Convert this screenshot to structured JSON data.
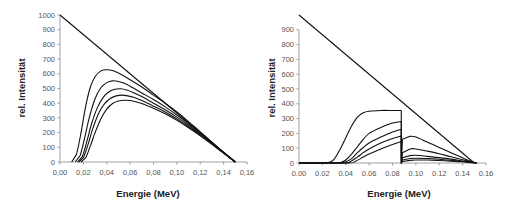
{
  "chart_data": [
    {
      "type": "line",
      "title": "",
      "xlabel": "Energie (MeV)",
      "ylabel": "rel. Intensität",
      "xlim": [
        0.0,
        0.16
      ],
      "ylim": [
        0,
        1000
      ],
      "decimal_separator": ",",
      "x_ticks": [
        "0,00",
        "0,02",
        "0,04",
        "0,06",
        "0,08",
        "0,10",
        "0,12",
        "0,14",
        "0,16"
      ],
      "y_ticks": [
        "0",
        "100",
        "200",
        "300",
        "400",
        "500",
        "600",
        "700",
        "800",
        "900",
        "1000"
      ],
      "grid": false,
      "legend": "none",
      "series": [
        {
          "name": "unfiltered",
          "x": [
            0.0,
            0.15
          ],
          "y": [
            1000,
            0
          ]
        },
        {
          "name": "filter-1",
          "x": [
            0.01,
            0.014,
            0.018,
            0.022,
            0.026,
            0.03,
            0.035,
            0.04,
            0.045,
            0.05,
            0.06,
            0.07,
            0.08,
            0.09,
            0.1,
            0.11,
            0.12,
            0.13,
            0.14,
            0.15
          ],
          "y": [
            0,
            50,
            200,
            380,
            510,
            580,
            620,
            628,
            622,
            605,
            560,
            510,
            455,
            400,
            340,
            275,
            205,
            135,
            65,
            0
          ]
        },
        {
          "name": "filter-2",
          "x": [
            0.013,
            0.017,
            0.021,
            0.025,
            0.03,
            0.035,
            0.04,
            0.045,
            0.05,
            0.055,
            0.06,
            0.07,
            0.08,
            0.09,
            0.1,
            0.11,
            0.12,
            0.13,
            0.14,
            0.15
          ],
          "y": [
            0,
            40,
            160,
            300,
            430,
            505,
            540,
            552,
            548,
            535,
            515,
            470,
            425,
            375,
            320,
            260,
            195,
            130,
            63,
            0
          ]
        },
        {
          "name": "filter-3",
          "x": [
            0.015,
            0.019,
            0.023,
            0.027,
            0.032,
            0.037,
            0.042,
            0.047,
            0.052,
            0.057,
            0.062,
            0.07,
            0.08,
            0.09,
            0.1,
            0.11,
            0.12,
            0.13,
            0.14,
            0.15
          ],
          "y": [
            0,
            35,
            140,
            260,
            370,
            440,
            478,
            495,
            498,
            490,
            475,
            445,
            400,
            355,
            305,
            250,
            190,
            127,
            62,
            0
          ]
        },
        {
          "name": "filter-4",
          "x": [
            0.016,
            0.02,
            0.024,
            0.028,
            0.033,
            0.038,
            0.043,
            0.048,
            0.053,
            0.058,
            0.063,
            0.07,
            0.08,
            0.09,
            0.1,
            0.11,
            0.12,
            0.13,
            0.14,
            0.15
          ],
          "y": [
            0,
            30,
            120,
            225,
            330,
            395,
            432,
            450,
            455,
            450,
            440,
            418,
            380,
            340,
            292,
            240,
            183,
            123,
            61,
            0
          ]
        },
        {
          "name": "filter-5",
          "x": [
            0.018,
            0.022,
            0.026,
            0.03,
            0.035,
            0.04,
            0.045,
            0.05,
            0.055,
            0.06,
            0.065,
            0.07,
            0.08,
            0.09,
            0.1,
            0.11,
            0.12,
            0.13,
            0.14,
            0.15
          ],
          "y": [
            0,
            30,
            110,
            200,
            295,
            360,
            398,
            415,
            420,
            418,
            410,
            398,
            365,
            328,
            283,
            233,
            178,
            120,
            60,
            0
          ]
        }
      ]
    },
    {
      "type": "line",
      "title": "",
      "xlabel": "Energie (MeV)",
      "ylabel": "rel. Intensität",
      "xlim": [
        0.0,
        0.16
      ],
      "ylim": [
        0,
        1000
      ],
      "decimal_separator": ".",
      "x_ticks": [
        "0.00",
        "0.02",
        "0.04",
        "0.06",
        "0.08",
        "0.10",
        "0.12",
        "0.14",
        "0.16"
      ],
      "y_ticks": [
        "0",
        "100",
        "200",
        "300",
        "400",
        "500",
        "600",
        "700",
        "800",
        "900"
      ],
      "grid": false,
      "legend": "none",
      "series": [
        {
          "name": "unfiltered",
          "x": [
            0.0,
            0.15
          ],
          "y": [
            1000,
            0
          ]
        },
        {
          "name": "filter-1",
          "x": [
            0.0,
            0.02,
            0.026,
            0.03,
            0.035,
            0.04,
            0.045,
            0.05,
            0.055,
            0.06,
            0.07,
            0.08,
            0.0875,
            0.0876,
            0.0885,
            0.095,
            0.1,
            0.11,
            0.12,
            0.13,
            0.14,
            0.148,
            0.152
          ],
          "y": [
            0,
            0,
            5,
            25,
            90,
            170,
            250,
            310,
            340,
            350,
            355,
            355,
            355,
            0,
            160,
            180,
            175,
            140,
            105,
            70,
            35,
            8,
            0
          ]
        },
        {
          "name": "filter-2",
          "x": [
            0.0,
            0.03,
            0.036,
            0.04,
            0.045,
            0.05,
            0.055,
            0.06,
            0.07,
            0.08,
            0.0875,
            0.0876,
            0.0885,
            0.095,
            0.1,
            0.11,
            0.12,
            0.13,
            0.14,
            0.148,
            0.152
          ],
          "y": [
            0,
            0,
            5,
            20,
            60,
            110,
            160,
            200,
            240,
            270,
            280,
            0,
            70,
            95,
            95,
            80,
            62,
            42,
            22,
            6,
            0
          ]
        },
        {
          "name": "filter-3",
          "x": [
            0.0,
            0.035,
            0.04,
            0.045,
            0.05,
            0.055,
            0.06,
            0.07,
            0.08,
            0.0875,
            0.0876,
            0.0885,
            0.095,
            0.1,
            0.11,
            0.12,
            0.13,
            0.14,
            0.148,
            0.152
          ],
          "y": [
            0,
            0,
            8,
            30,
            70,
            105,
            135,
            175,
            210,
            228,
            0,
            35,
            50,
            52,
            45,
            36,
            26,
            14,
            4,
            0
          ]
        },
        {
          "name": "filter-4",
          "x": [
            0.0,
            0.038,
            0.044,
            0.05,
            0.055,
            0.06,
            0.07,
            0.08,
            0.0875,
            0.0876,
            0.0885,
            0.095,
            0.1,
            0.11,
            0.12,
            0.13,
            0.14,
            0.148,
            0.152
          ],
          "y": [
            0,
            0,
            10,
            40,
            70,
            95,
            135,
            165,
            182,
            0,
            20,
            30,
            32,
            30,
            25,
            18,
            10,
            3,
            0
          ]
        },
        {
          "name": "filter-5",
          "x": [
            0.0,
            0.042,
            0.048,
            0.055,
            0.06,
            0.07,
            0.08,
            0.0875,
            0.0876,
            0.0885,
            0.095,
            0.1,
            0.11,
            0.12,
            0.13,
            0.14,
            0.148,
            0.152
          ],
          "y": [
            0,
            0,
            10,
            40,
            60,
            95,
            125,
            145,
            0,
            10,
            18,
            20,
            20,
            17,
            13,
            8,
            2,
            0
          ]
        }
      ]
    }
  ]
}
